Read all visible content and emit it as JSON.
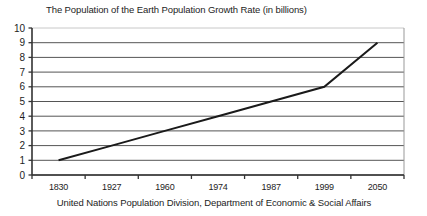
{
  "chart_data": {
    "type": "line",
    "title": "The Population of the Earth  Population Growth Rate  (in billions)",
    "caption": "United Nations Population Division,  Department of Economic & Social Affairs",
    "xlabel": "",
    "ylabel": "",
    "categories": [
      "1830",
      "1927",
      "1960",
      "1974",
      "1987",
      "1999",
      "2050"
    ],
    "x": [
      1830,
      1927,
      1960,
      1974,
      1987,
      1999,
      2050
    ],
    "values": [
      1,
      2,
      3,
      4,
      5,
      6,
      9
    ],
    "series": [
      {
        "name": "World population",
        "values": [
          1,
          2,
          3,
          4,
          5,
          6,
          9
        ]
      }
    ],
    "ylim": [
      0,
      10
    ],
    "yticks": [
      0,
      1,
      2,
      3,
      4,
      5,
      6,
      7,
      8,
      9,
      10
    ],
    "ytick_labels": [
      "0",
      "1",
      "2",
      "3",
      "4",
      "5",
      "6",
      "7",
      "8",
      "9",
      "10"
    ],
    "grid": true,
    "grid_axis": "y",
    "legend": "none",
    "line_color": "#1a1a1a",
    "grid_color": "#555555",
    "axis_color": "#333333",
    "background_color": "#ffffff"
  }
}
